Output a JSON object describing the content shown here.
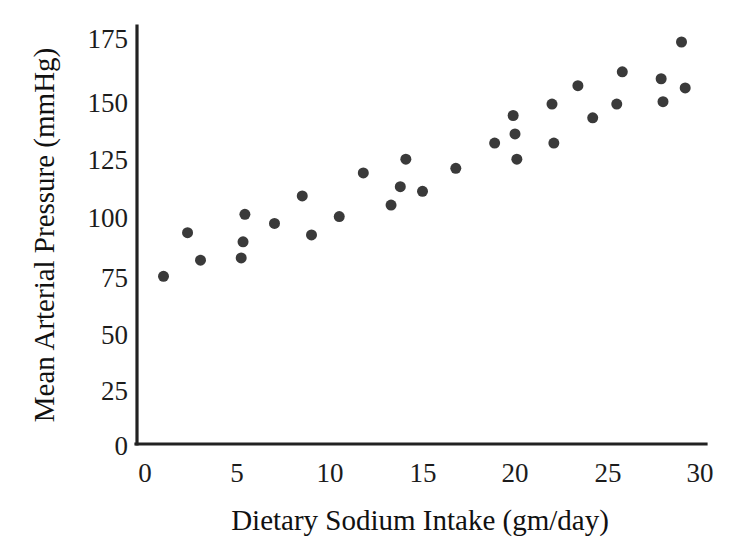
{
  "chart_data": {
    "type": "scatter",
    "title": "",
    "xlabel": "Dietary Sodium Intake (gm/day)",
    "ylabel": "Mean Arterial Pressure (mmHg)",
    "xlim": [
      0,
      30
    ],
    "ylim": [
      0,
      175
    ],
    "grid": false,
    "legend": null,
    "xticks": [
      0,
      5,
      10,
      15,
      20,
      25,
      30
    ],
    "xtick_labels": [
      "0",
      "5",
      "10",
      "15",
      "20",
      "25",
      "30"
    ],
    "yticks": [
      0,
      25,
      50,
      75,
      100,
      125,
      150,
      175
    ],
    "ytick_labels": [
      "0",
      "25",
      "50",
      "75",
      "100",
      "125",
      "150",
      "175"
    ],
    "marker": {
      "shape": "circle",
      "color": "#3a3a3a",
      "size_px": 11
    },
    "series": [
      {
        "name": "Subjects",
        "points": [
          {
            "x": 1.0,
            "y": 73
          },
          {
            "x": 2.3,
            "y": 92
          },
          {
            "x": 3.0,
            "y": 80
          },
          {
            "x": 5.2,
            "y": 81
          },
          {
            "x": 5.3,
            "y": 88
          },
          {
            "x": 5.4,
            "y": 100
          },
          {
            "x": 7.0,
            "y": 96
          },
          {
            "x": 8.5,
            "y": 108
          },
          {
            "x": 9.0,
            "y": 91
          },
          {
            "x": 10.5,
            "y": 99
          },
          {
            "x": 11.8,
            "y": 118
          },
          {
            "x": 13.3,
            "y": 104
          },
          {
            "x": 13.8,
            "y": 112
          },
          {
            "x": 14.1,
            "y": 124
          },
          {
            "x": 15.0,
            "y": 110
          },
          {
            "x": 16.8,
            "y": 120
          },
          {
            "x": 18.9,
            "y": 131
          },
          {
            "x": 19.9,
            "y": 143
          },
          {
            "x": 20.0,
            "y": 135
          },
          {
            "x": 20.1,
            "y": 124
          },
          {
            "x": 22.0,
            "y": 148
          },
          {
            "x": 22.1,
            "y": 131
          },
          {
            "x": 23.4,
            "y": 156
          },
          {
            "x": 24.2,
            "y": 142
          },
          {
            "x": 25.5,
            "y": 148
          },
          {
            "x": 25.8,
            "y": 162
          },
          {
            "x": 27.9,
            "y": 159
          },
          {
            "x": 28.0,
            "y": 149
          },
          {
            "x": 29.0,
            "y": 175
          },
          {
            "x": 29.2,
            "y": 155
          }
        ]
      }
    ],
    "colors": {
      "marker": "#3a3a3a",
      "axis": "#222222",
      "text": "#111111",
      "background": "#ffffff"
    }
  }
}
